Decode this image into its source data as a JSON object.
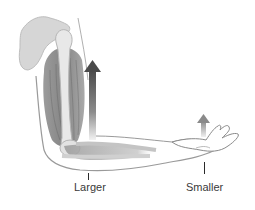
{
  "diagram": {
    "labels": {
      "elbow_force": "Larger",
      "hand_force": "Smaller"
    },
    "arrows": [
      {
        "name": "larger-force-arrow",
        "direction": "up",
        "size": "large",
        "color": "#4a4a4a"
      },
      {
        "name": "smaller-force-arrow",
        "direction": "up",
        "size": "small",
        "color": "#8a8a8a"
      }
    ],
    "colors": {
      "bone": "#e4e4e4",
      "bone_outline": "#b5b5b5",
      "muscle": "#7a7a7a",
      "skin_outline": "#9a9a9a",
      "label_text": "#3a3a3a"
    }
  }
}
